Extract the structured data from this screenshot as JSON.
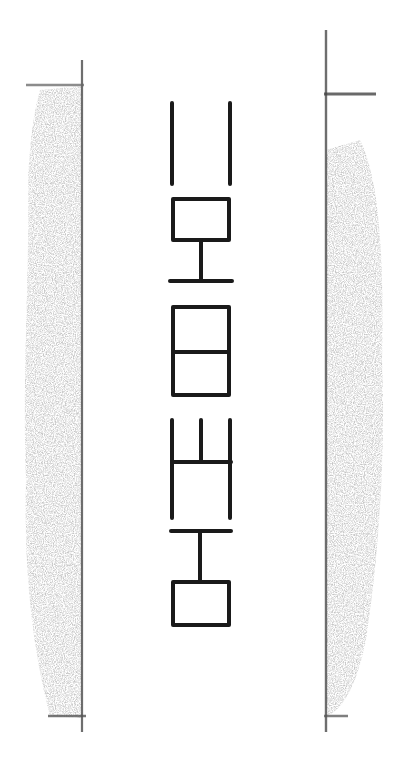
{
  "diagram": {
    "title": "",
    "colors": {
      "background": "#ffffff",
      "ink": "#1a1a1a",
      "shading": "#9a9a9a",
      "border_line": "#555555"
    },
    "borders": [
      {
        "side": "left",
        "x": 82,
        "y_top": 84,
        "y_bottom": 720,
        "shade_from_x": 22
      },
      {
        "side": "right",
        "x": 326,
        "y_top": 95,
        "y_bottom": 720,
        "shade_to_x": 385
      }
    ],
    "glyphs": [
      {
        "id": "glyph-1",
        "kind": "double-vertical-bars",
        "x_left": 172,
        "x_right": 230,
        "y_top": 102,
        "y_bottom": 185
      },
      {
        "id": "glyph-2",
        "kind": "box-over-stem-over-bar",
        "box": [
          172,
          198,
          230,
          240
        ],
        "stem_bottom": 282,
        "bar_y": 282
      },
      {
        "id": "glyph-3",
        "kind": "box-with-middle-divider",
        "box": [
          172,
          305,
          230,
          395
        ],
        "divider_y": 352
      },
      {
        "id": "glyph-4",
        "kind": "three-verticals-crossbar-two-verticals",
        "top_y": 418,
        "crossbar_y": 460,
        "bottom_y": 518
      },
      {
        "id": "glyph-5",
        "kind": "bar-over-stem-over-box",
        "bar_y": 531,
        "stem_top": 531,
        "box": [
          172,
          582,
          230,
          625
        ]
      }
    ]
  }
}
